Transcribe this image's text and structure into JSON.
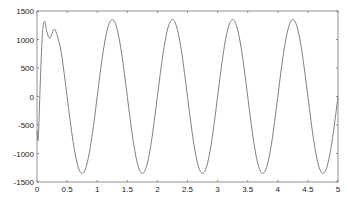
{
  "chart_data": {
    "type": "line",
    "title": "",
    "xlabel": "",
    "ylabel": "",
    "xlim": [
      0,
      5
    ],
    "ylim": [
      -1500,
      1500
    ],
    "xticks": [
      0,
      0.5,
      1,
      1.5,
      2,
      2.5,
      3,
      3.5,
      4,
      4.5,
      5
    ],
    "xtick_labels": [
      "0",
      "0.5",
      "1",
      "1.5",
      "2",
      "2.5",
      "3",
      "3.5",
      "4",
      "4.5",
      "5"
    ],
    "yticks": [
      1500,
      1000,
      500,
      0,
      -500,
      -1000,
      -1500
    ],
    "ytick_labels": [
      "1500",
      "1000",
      "500",
      "0",
      "-500",
      "-1000",
      "-1500"
    ],
    "grid": false,
    "legend": null,
    "line_color": "#808080",
    "series": [
      {
        "name": "signal",
        "transient": {
          "x": [
            0,
            0.02,
            0.04,
            0.06,
            0.08,
            0.1,
            0.13,
            0.16,
            0.2,
            0.23,
            0.27,
            0.3,
            0.35
          ],
          "y": [
            -600,
            -760,
            -200,
            400,
            900,
            1220,
            1320,
            1150,
            1030,
            1050,
            1160,
            1170,
            1020
          ]
        },
        "steady_state": {
          "x_start": 0.4,
          "x_end": 5,
          "x_step": 0.05,
          "cycle_values": [
            0,
            417,
            794,
            1092,
            1284,
            1350,
            1284,
            1092,
            794,
            417,
            0,
            -417,
            -794,
            -1092,
            -1284,
            -1350,
            -1284,
            -1092,
            -794,
            -417
          ],
          "cycle_step": 0.05,
          "period": 1
        }
      }
    ]
  }
}
